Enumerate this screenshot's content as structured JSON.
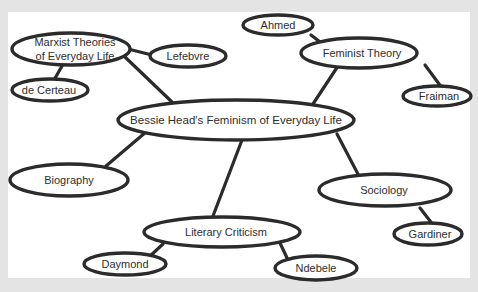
{
  "diagram": {
    "type": "mind-map",
    "colors": {
      "background": "#e4e4e4",
      "panel": "#ffffff",
      "stroke": "#2b2b2b",
      "text": "#2e2e2e"
    },
    "center": {
      "id": "center",
      "label": "Bessie Head's Feminism of Everyday Life"
    },
    "nodes": {
      "marxist": {
        "label_line1": "Marxist Theories",
        "label_line2": "of Everyday Life"
      },
      "lefebvre": {
        "label": "Lefebvre"
      },
      "decerteau": {
        "label": "de Certeau"
      },
      "feminist": {
        "label": "Feminist Theory"
      },
      "ahmed": {
        "label": "Ahmed"
      },
      "fraiman": {
        "label": "Fraiman"
      },
      "biography": {
        "label": "Biography"
      },
      "sociology": {
        "label": "Sociology"
      },
      "gardiner": {
        "label": "Gardiner"
      },
      "literary": {
        "label": "Literary Criticism"
      },
      "daymond": {
        "label": "Daymond"
      },
      "ndebele": {
        "label": "Ndebele"
      }
    },
    "edges": [
      [
        "center",
        "marxist"
      ],
      [
        "center",
        "feminist"
      ],
      [
        "center",
        "biography"
      ],
      [
        "center",
        "literary"
      ],
      [
        "center",
        "sociology"
      ],
      [
        "marxist",
        "lefebvre"
      ],
      [
        "marxist",
        "decerteau"
      ],
      [
        "feminist",
        "ahmed"
      ],
      [
        "feminist",
        "fraiman"
      ],
      [
        "sociology",
        "gardiner"
      ],
      [
        "literary",
        "daymond"
      ],
      [
        "literary",
        "ndebele"
      ]
    ]
  }
}
